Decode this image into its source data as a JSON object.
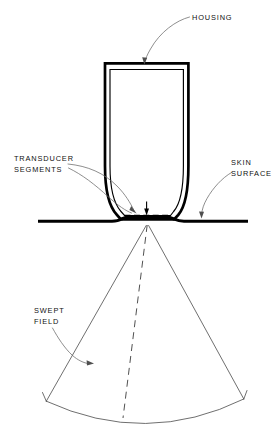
{
  "figure": {
    "background_color": "#ffffff",
    "ink_color": "#000000",
    "leader_color": "#6e6e6e",
    "width": 273,
    "height": 433
  },
  "callouts": {
    "housing": {
      "label": "HOUSING",
      "lines": [
        "HOUSING"
      ],
      "text_x": 192,
      "text_y": 20
    },
    "transducer_segments": {
      "label": "TRANSDUCER SEGMENTS",
      "lines": [
        "TRANSDUCER",
        "SEGMENTS"
      ],
      "text_x": 14,
      "text_y": 161
    },
    "skin_surface": {
      "label": "SKIN SURFACE",
      "lines": [
        "SKIN",
        "SURFACE"
      ],
      "text_x": 231,
      "text_y": 165
    },
    "swept_field": {
      "label": "SWEPT FIELD",
      "lines": [
        "SWEPT",
        "FIELD"
      ],
      "text_x": 34,
      "text_y": 313
    }
  },
  "parts": {
    "housing": {
      "name": "housing",
      "top_y": 62,
      "left_x": 105,
      "right_x": 188,
      "bottom_y": 221
    },
    "transducer_face": {
      "name": "transducer-segments",
      "dash_y": 216,
      "dash_start_x": 124,
      "dash_end_x": 170
    },
    "skin_surface": {
      "name": "skin-surface",
      "y": 221,
      "start_x": 38,
      "end_x": 248
    },
    "swept_field": {
      "name": "swept-field",
      "apex_x": 147,
      "apex_y": 224,
      "left_end_x": 46,
      "left_end_y": 401,
      "right_end_x": 244,
      "right_end_y": 399,
      "arc_depth_y": 427
    }
  }
}
